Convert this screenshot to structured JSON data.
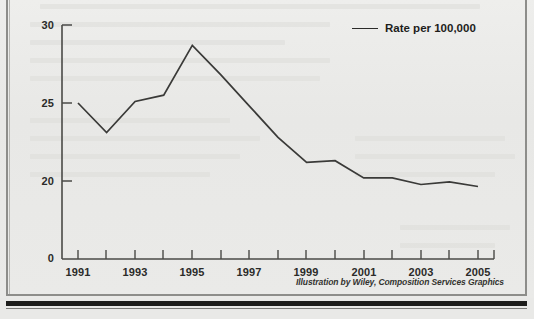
{
  "figure": {
    "legend_label": "Rate per 100,000",
    "credit": "Illustration by Wiley, Composition Services Graphics"
  },
  "chart_data": {
    "type": "line",
    "title": "",
    "xlabel": "",
    "ylabel": "",
    "legend": [
      "Rate per 100,000"
    ],
    "legend_position": "top-right",
    "grid": false,
    "line_color": "#3a3a38",
    "x": [
      1991,
      1992,
      1993,
      1994,
      1995,
      1996,
      1997,
      1998,
      1999,
      2000,
      2001,
      2002,
      2003,
      2004,
      2005
    ],
    "xtick_labels": [
      "1991",
      "1993",
      "1995",
      "1997",
      "1999",
      "2001",
      "2003",
      "2005"
    ],
    "xtick_values": [
      1991,
      1993,
      1995,
      1997,
      1999,
      2001,
      2003,
      2005
    ],
    "xlim": [
      1991,
      2005
    ],
    "ytick_labels": [
      "0",
      "20",
      "25",
      "30"
    ],
    "ytick_values": [
      0,
      20,
      25,
      30
    ],
    "ylim": [
      0,
      30
    ],
    "y_axis_broken": true,
    "series": [
      {
        "name": "Rate per 100,000",
        "values": [
          25.0,
          23.1,
          25.1,
          25.5,
          28.7,
          26.8,
          24.8,
          22.8,
          21.2,
          21.3,
          20.2,
          20.2,
          19.1,
          19.8,
          18.6
        ]
      }
    ]
  },
  "colors": {
    "page_background": "#e9e9e7",
    "line": "#3a3a38",
    "axis": "#4a4a47",
    "text": "#1d1d1b",
    "rule": "#1d1d1b"
  }
}
